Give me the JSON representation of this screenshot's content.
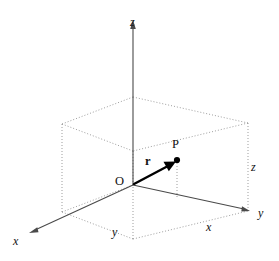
{
  "figure": {
    "kind": "3d-cartesian-coordinate-diagram",
    "background_color": "#ffffff",
    "width": 279,
    "height": 261,
    "colors": {
      "axis": "#4a4a4a",
      "box_edge": "#8d8d8d",
      "vector": "#000000",
      "label": "#111111"
    }
  },
  "axes": [
    {
      "id": "z-axis",
      "label": "z",
      "style": "italic",
      "direction": "up",
      "label_x": 130,
      "label_y": 16
    },
    {
      "id": "x-axis",
      "label": "x",
      "style": "italic",
      "direction": "down-left-front",
      "label_x": 13,
      "label_y": 235
    },
    {
      "id": "y-axis",
      "label": "y",
      "style": "italic",
      "direction": "down-right-front",
      "label_x": 258,
      "label_y": 207
    }
  ],
  "points": [
    {
      "id": "origin",
      "label": "O",
      "style": "upright",
      "label_x": 115,
      "label_y": 175
    },
    {
      "id": "point-p",
      "label": "P",
      "style": "upright",
      "label_x": 172,
      "label_y": 138,
      "dot_x": 177,
      "dot_y": 160
    }
  ],
  "vectors": [
    {
      "id": "position-vector-r",
      "label": "r",
      "style": "bold",
      "label_x": 145,
      "label_y": 155,
      "from": "origin",
      "to": "point-p"
    }
  ],
  "dimension_labels": [
    {
      "id": "dimension-y",
      "label": "y",
      "style": "italic",
      "edge": "bottom-front-left",
      "label_x": 112,
      "label_y": 226
    },
    {
      "id": "dimension-x",
      "label": "x",
      "style": "italic",
      "edge": "bottom-front-right",
      "label_x": 206,
      "label_y": 221
    },
    {
      "id": "dimension-z",
      "label": "z",
      "style": "italic",
      "edge": "right-vertical",
      "label_x": 251,
      "label_y": 161
    }
  ],
  "geometry": {
    "origin": {
      "x": 133,
      "y": 185
    },
    "z_axis_tip": {
      "x": 133,
      "y": 22
    },
    "x_axis_tip": {
      "x": 30,
      "y": 232
    },
    "y_axis_tip": {
      "x": 249,
      "y": 211
    },
    "point_p": {
      "x": 177,
      "y": 160
    },
    "box": {
      "bottom_back_left": {
        "x": 62,
        "y": 212
      },
      "bottom_origin": {
        "x": 133,
        "y": 185
      },
      "bottom_back_right": {
        "x": 248,
        "y": 211
      },
      "bottom_front": {
        "x": 133,
        "y": 239
      },
      "top_back_left": {
        "x": 62,
        "y": 124
      },
      "top_back": {
        "x": 133,
        "y": 97
      },
      "top_back_right": {
        "x": 248,
        "y": 123
      },
      "top_front": {
        "x": 133,
        "y": 151
      }
    }
  }
}
